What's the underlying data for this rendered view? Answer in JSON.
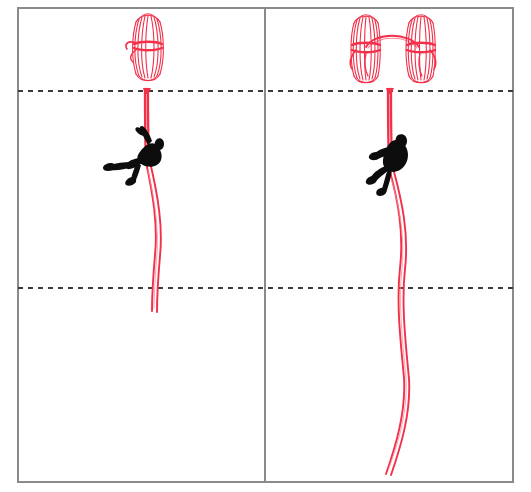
{
  "diagram": {
    "panel_count": 2,
    "frame": {
      "x": 17,
      "y": 7,
      "width": 497,
      "height": 476,
      "border_color": "#8a8a8a",
      "border_width": 2,
      "fill_color": "#ffffff"
    },
    "divider": {
      "name": "panel-divider",
      "x": 265,
      "y_top": 7,
      "y_bottom": 483,
      "color": "#8a8a8a",
      "width": 2
    },
    "guide_lines": [
      {
        "name": "upper-anchor-line",
        "label": "anchor level",
        "y": 91,
        "x_start": 17,
        "x_end": 514,
        "style": "dashed",
        "color": "#3a3a3a",
        "dash": "5 5",
        "width": 2
      },
      {
        "name": "lower-reference-line",
        "label": "mid reference level",
        "y": 288,
        "x_start": 17,
        "x_end": 514,
        "style": "dashed",
        "color": "#3a3a3a",
        "dash": "5 5",
        "width": 2
      }
    ],
    "rope_color": "#f2304a",
    "rope_highlight_color": "#ff8a99",
    "figure_color": "#0d0d0d"
  },
  "panels": [
    {
      "id": "left",
      "name": "single-coil-panel",
      "label": "Single coil deployment",
      "bounds": {
        "x": 17,
        "y": 7,
        "width": 248,
        "height": 476
      },
      "coil": {
        "name": "rope-coil-single",
        "label": "single rope coil",
        "center_x": 148,
        "top_y": 14,
        "bottom_y": 80,
        "width": 28,
        "strand_count": 9,
        "has_cinch": true,
        "cinch_y": 46
      },
      "anchor": {
        "name": "rope-anchor-point-left",
        "x": 146,
        "y": 91
      },
      "climber": {
        "name": "climber-figure-left",
        "label": "rappeller in seated horizontal posture",
        "center_x": 139,
        "center_y": 158,
        "posture": "horizontal-seated"
      },
      "rope": {
        "name": "rope-strand-left",
        "label": "deployed rope tail",
        "start_y": 91,
        "end_y": 312,
        "strands": 2,
        "curve": "gentle-s"
      }
    },
    {
      "id": "right",
      "name": "double-coil-panel",
      "label": "Double coil deployment",
      "bounds": {
        "x": 265,
        "y": 7,
        "width": 249,
        "height": 476
      },
      "coils": [
        {
          "name": "rope-coil-left-of-pair",
          "label": "left rope coil",
          "center_x": 365,
          "top_y": 14,
          "bottom_y": 82,
          "width": 26,
          "strand_count": 9,
          "has_cinch": true,
          "cinch_y": 48
        },
        {
          "name": "rope-coil-right-of-pair",
          "label": "right rope coil",
          "center_x": 420,
          "top_y": 14,
          "bottom_y": 82,
          "width": 26,
          "strand_count": 9,
          "has_cinch": true,
          "cinch_y": 48
        }
      ],
      "coil_link": {
        "name": "coil-connecting-arc",
        "label": "rope arc linking both coils",
        "from_x": 365,
        "to_x": 420,
        "apex_y": 34,
        "base_y": 47
      },
      "anchor": {
        "name": "rope-anchor-point-right",
        "x": 390,
        "y": 91
      },
      "climber": {
        "name": "climber-figure-right",
        "label": "rappeller in upright descending posture",
        "center_x": 390,
        "center_y": 158,
        "posture": "upright-descending"
      },
      "rope": {
        "name": "rope-strand-right",
        "label": "deployed rope tail",
        "start_y": 91,
        "end_y": 476,
        "strands": 2,
        "curve": "deep-s"
      }
    }
  ]
}
